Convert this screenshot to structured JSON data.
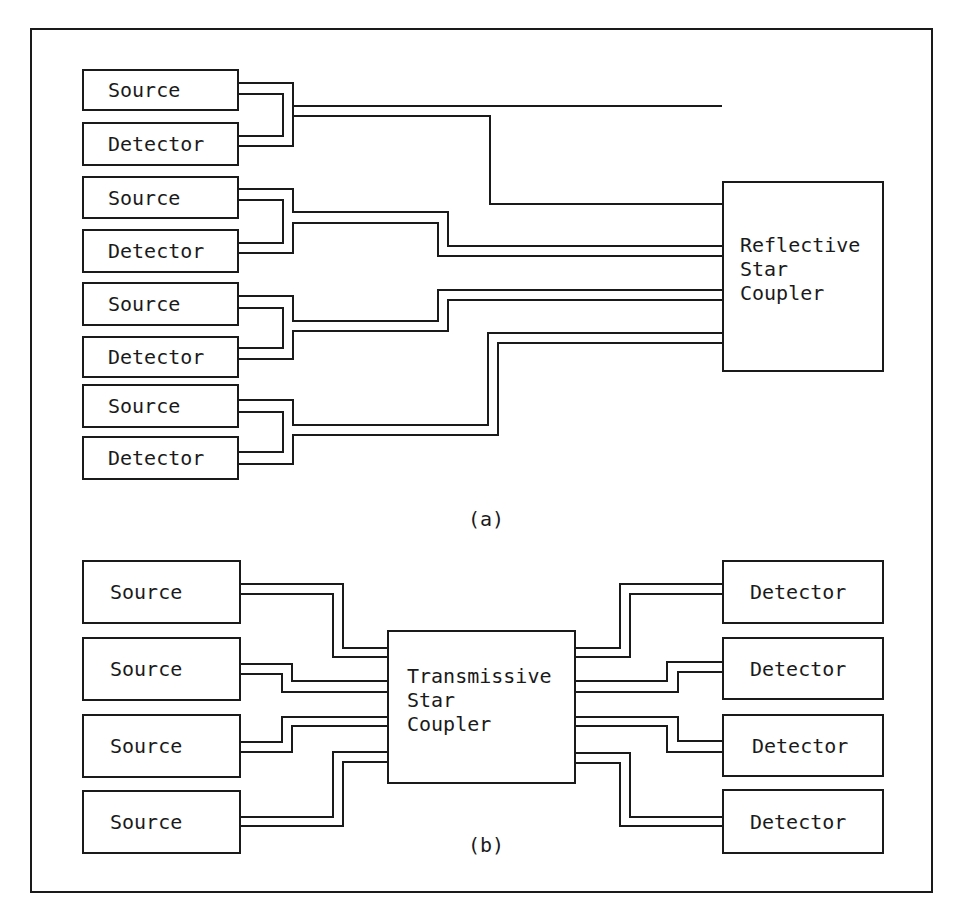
{
  "figure": {
    "panel_a": {
      "caption": "(a)",
      "coupler_label": "Reflective\nStar\nCoupler",
      "nodes": [
        {
          "label": "Source"
        },
        {
          "label": "Detector"
        },
        {
          "label": "Source"
        },
        {
          "label": "Detector"
        },
        {
          "label": "Source"
        },
        {
          "label": "Detector"
        },
        {
          "label": "Source"
        },
        {
          "label": "Detector"
        }
      ]
    },
    "panel_b": {
      "caption": "(b)",
      "coupler_label": "Transmissive\nStar\nCoupler",
      "sources": [
        {
          "label": "Source"
        },
        {
          "label": "Source"
        },
        {
          "label": "Source"
        },
        {
          "label": "Source"
        }
      ],
      "detectors": [
        {
          "label": "Detector"
        },
        {
          "label": "Detector"
        },
        {
          "label": "Detector"
        },
        {
          "label": "Detector"
        }
      ]
    },
    "colors": {
      "line": "#1a1a1a",
      "background": "#ffffff"
    }
  }
}
